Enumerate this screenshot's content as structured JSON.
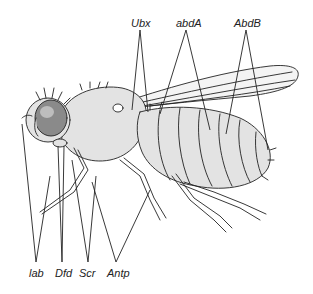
{
  "diagram": {
    "colors": {
      "line": "#222222",
      "body_fill": "#e3e3e3",
      "eye_fill": "#8a8a8a",
      "background": "#ffffff"
    },
    "labels_top": [
      {
        "id": "ubx",
        "text": "Ubx",
        "x": 131,
        "y": 17
      },
      {
        "id": "abda",
        "text": "abdA",
        "x": 176,
        "y": 17
      },
      {
        "id": "abdb",
        "text": "AbdB",
        "x": 238,
        "y": 17
      }
    ],
    "labels_bottom": [
      {
        "id": "lab",
        "text": "lab",
        "x": 28,
        "y": 267
      },
      {
        "id": "dfd",
        "text": "Dfd",
        "x": 54,
        "y": 267
      },
      {
        "id": "scr",
        "text": "Scr",
        "x": 79,
        "y": 267
      },
      {
        "id": "antp",
        "text": "Antp",
        "x": 108,
        "y": 267
      }
    ]
  }
}
